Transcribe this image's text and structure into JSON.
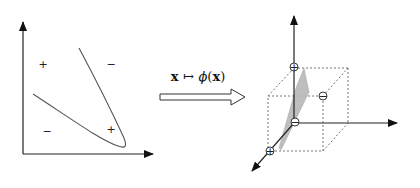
{
  "input_space": {
    "region_signs": [
      "+",
      "−",
      "−",
      "+"
    ]
  },
  "mapping": {
    "label_x": "x",
    "label_arrow": "↦",
    "label_phi": "ϕ",
    "label_open": "(",
    "label_arg": "x",
    "label_close": ")"
  },
  "feature_space": {
    "point_signs": [
      "+",
      "−",
      "−",
      "+"
    ]
  },
  "colors": {
    "stroke": "#222222",
    "curve": "#555555",
    "plane_fill": "#b8b8b8",
    "dashed": "#666666"
  }
}
